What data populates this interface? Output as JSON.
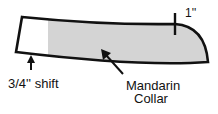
{
  "diagram": {
    "labels": {
      "shift": "3/4'' shift",
      "measure": "1''",
      "piece_name_line1": "Mandarin",
      "piece_name_line2": "Collar"
    },
    "colors": {
      "outline": "#111111",
      "shading": "#d4d4d4",
      "background": "#ffffff"
    }
  }
}
